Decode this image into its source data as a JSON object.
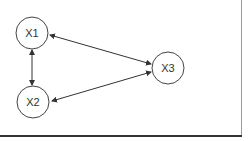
{
  "diagram": {
    "nodes": [
      {
        "id": "X1",
        "label": "X1"
      },
      {
        "id": "X2",
        "label": "X2"
      },
      {
        "id": "X3",
        "label": "X3"
      }
    ],
    "edges": [
      {
        "from": "X1",
        "to": "X2",
        "direction": "bidirectional"
      },
      {
        "from": "X1",
        "to": "X3",
        "direction": "bidirectional"
      },
      {
        "from": "X2",
        "to": "X3",
        "direction": "bidirectional"
      }
    ]
  }
}
